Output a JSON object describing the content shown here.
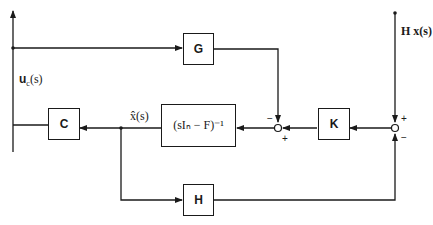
{
  "diagram": {
    "type": "block-diagram",
    "blocks": {
      "G": "G",
      "C": "C",
      "K": "K",
      "H": "H",
      "inverse": "(sIₙ − F)⁻¹"
    },
    "signals": {
      "control": "u_c(s)",
      "control_main": "u",
      "control_sub": "c",
      "control_arg": "(s)",
      "estimate": "x̂(s)",
      "measurement": "H x(s)"
    },
    "sum1": {
      "top_sign": "−",
      "bottom_sign": "+"
    },
    "sum2": {
      "top_sign": "+",
      "bottom_sign": "−"
    },
    "colors": {
      "line": "#1a1a1a",
      "background": "#ffffff"
    }
  }
}
